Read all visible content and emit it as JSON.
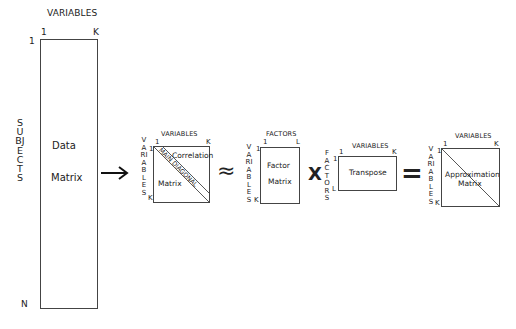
{
  "data_matrix": {
    "top_label": "VARIABLES",
    "col_start": "1",
    "col_end": "K",
    "row_start": "1",
    "row_end": "N",
    "side_label": "SUBJECTS",
    "name_line1": "Data",
    "name_line2": "Matrix"
  },
  "correlation_matrix": {
    "top_label": "VARIABLES",
    "col_start": "1",
    "col_end": "K",
    "row_start": "1",
    "row_end": "K",
    "side_label": "VARIABLES",
    "name_line1": "Correlation",
    "name_line2": "Matrix",
    "diagonal_label": "MAIN DIAGONAL"
  },
  "factor_matrix": {
    "top_label": "FACTORS",
    "col_start": "1",
    "col_end": "L",
    "row_start": "1",
    "row_end": "K",
    "side_label": "VARIABLES",
    "name_line1": "Factor",
    "name_line2": "Matrix"
  },
  "transpose_matrix": {
    "top_label": "VARIABLES",
    "col_start": "1",
    "col_end": "K",
    "row_start": "1",
    "row_end": "L",
    "side_label": "FACTORS",
    "name": "Transpose"
  },
  "approximation_matrix": {
    "top_label": "VARIABLES",
    "col_start": "1",
    "col_end": "K",
    "row_start": "1",
    "row_end": "K",
    "side_label": "VARIABLES",
    "name_line1": "Approximation",
    "name_line2": "Matrix"
  },
  "operators": {
    "arrow": "→",
    "approx": "≈",
    "times": "X",
    "equals": "="
  }
}
